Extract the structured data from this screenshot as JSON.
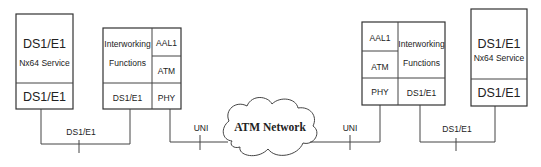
{
  "left_device": {
    "title": "DS1/E1",
    "subtitle": "Nx64 Service",
    "bottom": "DS1/E1"
  },
  "left_iwf": {
    "iwf_line1": "Interworking",
    "iwf_line2": "Functions",
    "aal": "AAL1",
    "atm": "ATM",
    "ds": "DS1/E1",
    "phy": "PHY"
  },
  "right_iwf": {
    "iwf_line1": "Interworking",
    "iwf_line2": "Functions",
    "aal": "AAL1",
    "atm": "ATM",
    "ds": "DS1/E1",
    "phy": "PHY"
  },
  "right_device": {
    "title": "DS1/E1",
    "subtitle": "Nx64 Service",
    "bottom": "DS1/E1"
  },
  "links": {
    "left_ds": "DS1/E1",
    "left_uni": "UNI",
    "right_uni": "UNI",
    "right_ds": "DS1/E1"
  },
  "network": {
    "label": "ATM Network"
  }
}
